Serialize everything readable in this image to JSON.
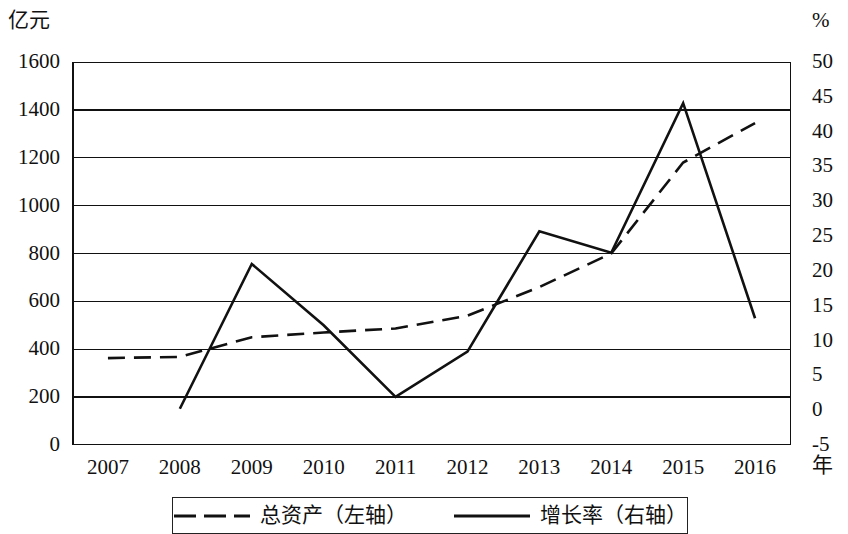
{
  "chart_data": {
    "type": "line",
    "title": "",
    "xlabel": "年",
    "categories": [
      "2007",
      "2008",
      "2009",
      "2010",
      "2011",
      "2012",
      "2013",
      "2014",
      "2015",
      "2016"
    ],
    "grid": true,
    "legend_position": "bottom",
    "axes": {
      "left": {
        "unit": "亿元",
        "ticks": [
          "1600",
          "1400",
          "1200",
          "1000",
          "800",
          "600",
          "400",
          "200",
          "0"
        ],
        "tick_values": [
          1600,
          1400,
          1200,
          1000,
          800,
          600,
          400,
          200,
          0
        ],
        "min": 0,
        "max": 1600,
        "step": 200
      },
      "right": {
        "unit": "%",
        "ticks": [
          "50",
          "45",
          "40",
          "35",
          "30",
          "25",
          "20",
          "15",
          "10",
          "5",
          "0",
          "-5"
        ],
        "tick_values": [
          50,
          45,
          40,
          35,
          30,
          25,
          20,
          15,
          10,
          5,
          0,
          -5
        ],
        "min": -5,
        "max": 50,
        "step": 5
      }
    },
    "series": [
      {
        "name": "总资产（左轴）",
        "axis": "left",
        "style": "dashed",
        "color": "#111111",
        "values": [
          363,
          368,
          450,
          470,
          487,
          540,
          660,
          800,
          1180,
          1345
        ]
      },
      {
        "name": "增长率（右轴）",
        "axis": "right",
        "style": "solid",
        "color": "#111111",
        "values": [
          null,
          0.2,
          21.0,
          12.2,
          1.9,
          8.4,
          25.7,
          22.6,
          44.1,
          13.2
        ]
      }
    ]
  },
  "legend": {
    "entries": [
      {
        "label": "总资产（左轴）",
        "style": "dashed"
      },
      {
        "label": "增长率（右轴）",
        "style": "solid"
      }
    ]
  }
}
